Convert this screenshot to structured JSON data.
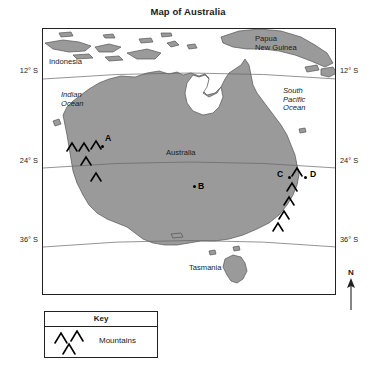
{
  "title": "Map of Australia",
  "map": {
    "country_labels": [
      {
        "name": "indonesia",
        "text": "Indonesia",
        "x": 6,
        "y": 29,
        "italic": false
      },
      {
        "name": "papua-new-guinea",
        "text": "Papua\nNew Guinea",
        "x": 212,
        "y": 6,
        "italic": false
      },
      {
        "name": "australia",
        "text": "Australia",
        "x": 123,
        "y": 120,
        "italic": false
      },
      {
        "name": "tasmania",
        "text": "Tasmania",
        "x": 146,
        "y": 235,
        "italic": false
      }
    ],
    "ocean_labels": [
      {
        "name": "indian-ocean",
        "text": "Indian\nOcean",
        "x": 18,
        "y": 62,
        "italic": true
      },
      {
        "name": "south-pacific-ocean",
        "text": "South\nPacific\nOcean",
        "x": 240,
        "y": 58,
        "italic": true
      }
    ],
    "points": [
      {
        "name": "point-a",
        "label": "A",
        "label_x": 62,
        "label_y": 104,
        "dot_x": 58,
        "dot_y": 116
      },
      {
        "name": "point-b",
        "label": "B",
        "label_x": 155,
        "label_y": 152,
        "dot_x": 150,
        "dot_y": 156
      },
      {
        "name": "point-c",
        "label": "C",
        "label_x": 234,
        "label_y": 140,
        "dot_x": 245,
        "dot_y": 147
      },
      {
        "name": "point-d",
        "label": "D",
        "label_x": 267,
        "label_y": 140,
        "dot_x": 261,
        "dot_y": 147
      }
    ],
    "latitudes": [
      {
        "name": "lat-12s",
        "text": "12° S",
        "y": 72
      },
      {
        "name": "lat-24s",
        "text": "24° S",
        "y": 162
      },
      {
        "name": "lat-36s",
        "text": "36° S",
        "y": 241
      }
    ],
    "colors": {
      "land": "#9a9a9a",
      "land_stroke": "#555555",
      "ocean": "#ffffff",
      "frame": "#222222",
      "graticule": "#666666",
      "text": "#1a1a1a"
    }
  },
  "compass": {
    "letter": "N",
    "icon": "north-arrow-icon"
  },
  "key": {
    "title": "Key",
    "items": [
      {
        "name": "key-item-mountains",
        "label": "Mountains",
        "symbol": "mountains-chevron-icon"
      }
    ]
  }
}
